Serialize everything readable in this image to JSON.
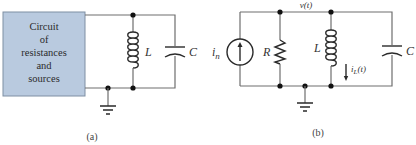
{
  "colors": {
    "box_fill": "#b9cadf",
    "box_border": "#7f8fa3",
    "wire": "#6e6e6e",
    "component": "#2a2a2a",
    "node": "#111111"
  },
  "circuit_a": {
    "caption": "(a)",
    "box_lines": [
      "Circuit",
      "of",
      "resistances",
      "and",
      "sources"
    ],
    "inductor_label": "L",
    "capacitor_label": "C"
  },
  "circuit_b": {
    "caption": "(b)",
    "voltage_label": "v(t)",
    "source_label_main": "i",
    "source_label_sub": "n",
    "resistor_label": "R",
    "inductor_label": "L",
    "capacitor_label": "C",
    "inductor_current_main": "i",
    "inductor_current_sub": "L",
    "inductor_current_tail": "(t)"
  }
}
